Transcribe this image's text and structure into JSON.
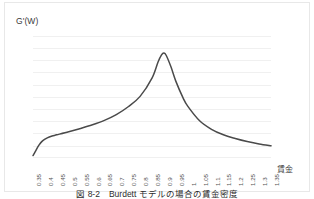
{
  "figure": {
    "caption": "図 8-2　Burdett モデルの場合の賃金密度"
  },
  "axes": {
    "ylabel": "G'(W)",
    "xlabel": "賃金"
  },
  "colors": {
    "curve": "#4a4a4a",
    "gridline": "#f0f0f0",
    "frame": "#e8e8e8",
    "text": "#3a3a3a"
  },
  "chart_data": {
    "type": "line",
    "title": "",
    "xlabel": "賃金",
    "ylabel": "G'(W)",
    "grid": true,
    "legend": false,
    "xlim": [
      0.35,
      1.35
    ],
    "ylim": [
      0,
      10
    ],
    "x_tick_labels": [
      "0.35",
      "0.4",
      "0.45",
      "0.5",
      "0.55",
      "0.6",
      "0.65",
      "0.7",
      "0.75",
      "0.8",
      "0.85",
      "0.9",
      "0.95",
      "1",
      "1.05",
      "1.1",
      "1.15",
      "1.2",
      "1.25",
      "1.3",
      "1.35"
    ],
    "y_tick_labels": [],
    "series": [
      {
        "name": "G'(W)",
        "x": [
          0.35,
          0.36,
          0.375,
          0.39,
          0.41,
          0.43,
          0.45,
          0.5,
          0.55,
          0.6,
          0.65,
          0.7,
          0.75,
          0.8,
          0.85,
          0.875,
          0.89,
          0.9,
          0.91,
          0.93,
          0.95,
          0.98,
          1.0,
          1.05,
          1.1,
          1.15,
          1.2,
          1.25,
          1.3,
          1.35
        ],
        "values": [
          0.2,
          0.55,
          1.05,
          1.4,
          1.65,
          1.8,
          1.9,
          2.15,
          2.42,
          2.72,
          3.08,
          3.55,
          4.2,
          5.05,
          6.55,
          7.85,
          8.45,
          8.6,
          8.4,
          7.45,
          6.3,
          4.95,
          4.25,
          3.05,
          2.35,
          1.9,
          1.6,
          1.35,
          1.15,
          1.0
        ]
      }
    ]
  }
}
